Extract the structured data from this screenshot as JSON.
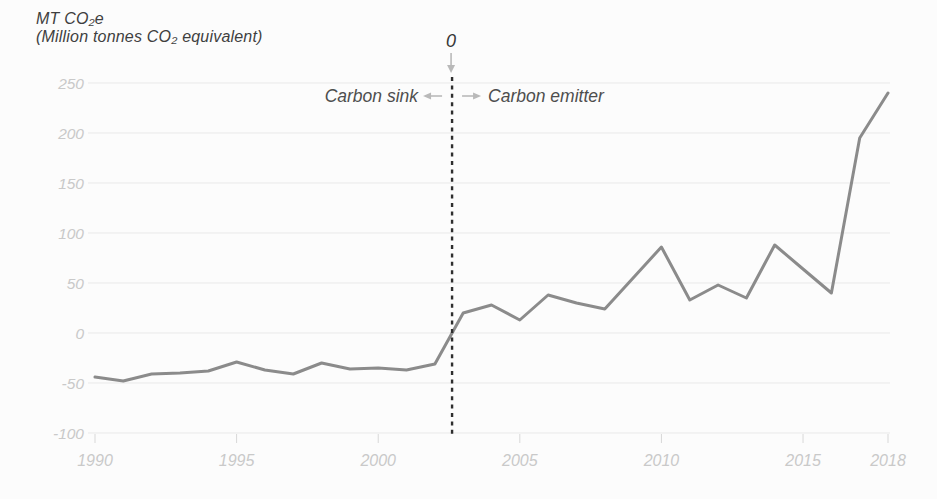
{
  "figure": {
    "title_line1": "MT CO₂e",
    "title_line2": "(Million tonnes CO₂ equivalent)"
  },
  "annotations": {
    "zero_label": "0",
    "sink_label": "Carbon sink",
    "emitter_label": "Carbon emitter"
  },
  "chart_data": {
    "type": "line",
    "title": "MT CO₂e (Million tonnes CO₂ equivalent)",
    "xlabel": "Year",
    "ylabel": "MT CO₂e",
    "x": [
      1990,
      1991,
      1992,
      1993,
      1994,
      1995,
      1996,
      1997,
      1998,
      1999,
      2000,
      2001,
      2002,
      2003,
      2004,
      2005,
      2006,
      2007,
      2008,
      2009,
      2010,
      2011,
      2012,
      2013,
      2014,
      2015,
      2016,
      2017,
      2018
    ],
    "values": [
      -44,
      -48,
      -41,
      -40,
      -38,
      -29,
      -37,
      -41,
      -30,
      -36,
      -35,
      -37,
      -31,
      20,
      28,
      13,
      38,
      30,
      24,
      55,
      86,
      33,
      48,
      35,
      88,
      64,
      40,
      195,
      240
    ],
    "x_ticks": [
      1990,
      1995,
      2000,
      2005,
      2010,
      2015,
      2018
    ],
    "y_ticks": [
      250,
      200,
      150,
      100,
      50,
      0,
      -50,
      -100
    ],
    "xlim": [
      1990,
      2018
    ],
    "ylim": [
      -100,
      250
    ],
    "grid": true,
    "legend": "none",
    "colors": {
      "line": "#8b8b8b",
      "grid": "#e9e9e9",
      "tick_label": "#c9c9c9",
      "tick_mark": "#d8d8d8",
      "divider": "#2e2e2e",
      "annotation_text": "#4e4e4e",
      "zero_text": "#383838",
      "arrow": "#b9b9b9",
      "background": "#fcfcfc"
    }
  }
}
